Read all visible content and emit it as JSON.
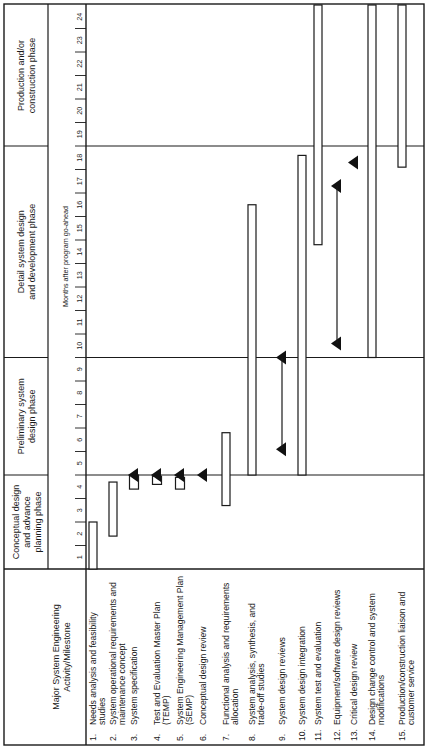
{
  "chart_data": {
    "type": "gantt",
    "orientation": "rotated-90-ccw",
    "header_label": "Major System Engineering Activity/Milestone",
    "axis_label": "Months after program go-ahead",
    "months": [
      "1",
      "2",
      "3",
      "4",
      "5",
      "6",
      "7",
      "8",
      "9",
      "10",
      "11",
      "12",
      "13",
      "14",
      "15",
      "16",
      "17",
      "18",
      "19",
      "20",
      "21",
      "22",
      "23",
      "24"
    ],
    "month_range": [
      0,
      24
    ],
    "phases": [
      {
        "label": "Conceptual design and advance planning phase",
        "start": 0,
        "end": 4
      },
      {
        "label": "Preliminary system design phase",
        "start": 4,
        "end": 9
      },
      {
        "label": "Detail system design and development phase",
        "start": 9,
        "end": 18
      },
      {
        "label": "Production and/or construction phase",
        "start": 18,
        "end": 24
      }
    ],
    "activities": [
      {
        "num": "1.",
        "label": "Needs analysis and feasibility studies",
        "bars": [
          [
            0,
            2
          ]
        ],
        "milestones": []
      },
      {
        "num": "2.",
        "label": "System operational requirements and maintenance concept",
        "bars": [
          [
            1.4,
            3.7
          ]
        ],
        "milestones": []
      },
      {
        "num": "3.",
        "label": "System specification",
        "bars": [
          [
            3.4,
            4.0
          ]
        ],
        "milestones": [
          4
        ]
      },
      {
        "num": "4.",
        "label": "Test and Evaluation Master Plan (TEMP)",
        "bars": [
          [
            3.6,
            3.95
          ]
        ],
        "milestones": [
          4
        ]
      },
      {
        "num": "5.",
        "label": "System Engineering Management Plan (SEMP)",
        "bars": [
          [
            3.4,
            3.9
          ]
        ],
        "milestones": [
          4
        ]
      },
      {
        "num": "6.",
        "label": "Conceptual design review",
        "bars": [],
        "milestones": [
          4
        ]
      },
      {
        "num": "7.",
        "label": "Functional analysis and requirements allocation",
        "bars": [
          [
            2.7,
            5.8
          ]
        ],
        "milestones": []
      },
      {
        "num": "8.",
        "label": "System analysis, synthesis, and trade-off studies",
        "bars": [
          [
            4,
            15.5
          ]
        ],
        "milestones": []
      },
      {
        "num": "9.",
        "label": "System design reviews",
        "bars": [],
        "milestones": [
          5.1,
          9
        ]
      },
      {
        "num": "10.",
        "label": "System design integration",
        "bars": [
          [
            4,
            17.6
          ]
        ],
        "milestones": []
      },
      {
        "num": "11.",
        "label": "System test and evaluation",
        "bars": [
          [
            13.8,
            24
          ]
        ],
        "milestones": []
      },
      {
        "num": "12.",
        "label": "Equipment/software design reviews",
        "bars": [],
        "milestones": [
          9.6,
          16.3
        ]
      },
      {
        "num": "13.",
        "label": "Critical design review",
        "bars": [],
        "milestones": [
          17.3
        ]
      },
      {
        "num": "14.",
        "label": "Design change control and system modifications",
        "bars": [
          [
            9,
            24
          ]
        ],
        "milestones": []
      },
      {
        "num": "15.",
        "label": "Production/construction liaison and customer service",
        "bars": [
          [
            17.1,
            24
          ]
        ],
        "milestones": []
      }
    ]
  }
}
